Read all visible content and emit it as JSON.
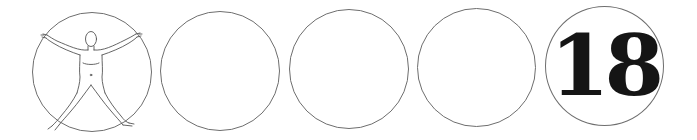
{
  "panels": [
    {
      "id": "figure",
      "content": "vitruvian-figure",
      "label": ""
    },
    {
      "id": "blank-1",
      "content": "empty",
      "label": ""
    },
    {
      "id": "blank-2",
      "content": "empty",
      "label": ""
    },
    {
      "id": "blank-3",
      "content": "empty",
      "label": ""
    },
    {
      "id": "number",
      "content": "number",
      "label": "18"
    }
  ],
  "colors": {
    "outline": "#6e6e6e",
    "figure_line": "#555555",
    "number": "#151515",
    "background": "#ffffff"
  }
}
